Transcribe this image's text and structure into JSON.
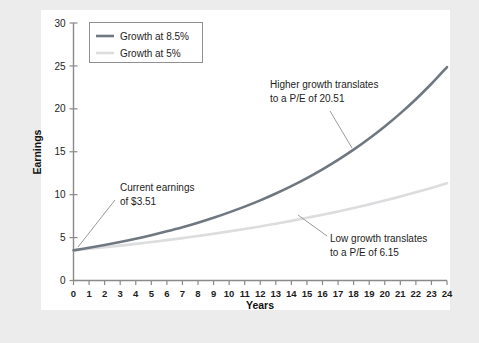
{
  "figure": {
    "background_color": "#ececed",
    "card_color": "#ffffff"
  },
  "chart_data": {
    "type": "line",
    "title": "",
    "xlabel": "Years",
    "ylabel": "Earnings",
    "xlim": [
      0,
      24
    ],
    "ylim": [
      0,
      30
    ],
    "grid": false,
    "legend_position": "top-left",
    "x_ticks": [
      "0",
      "1",
      "2",
      "3",
      "4",
      "5",
      "6",
      "7",
      "8",
      "9",
      "10",
      "11",
      "12",
      "13",
      "14",
      "15",
      "16",
      "17",
      "18",
      "19",
      "20",
      "21",
      "22",
      "23",
      "24"
    ],
    "y_ticks": [
      "0",
      "5",
      "10",
      "15",
      "20",
      "25",
      "30"
    ],
    "x": [
      0,
      1,
      2,
      3,
      4,
      5,
      6,
      7,
      8,
      9,
      10,
      11,
      12,
      13,
      14,
      15,
      16,
      17,
      18,
      19,
      20,
      21,
      22,
      23,
      24
    ],
    "series": [
      {
        "name": "Growth at 8.5%",
        "color": "#6f7881",
        "width": 2.6,
        "values": [
          3.51,
          3.81,
          4.13,
          4.48,
          4.86,
          5.28,
          5.73,
          6.21,
          6.74,
          7.31,
          7.94,
          8.61,
          9.34,
          10.14,
          11.0,
          11.93,
          12.95,
          14.05,
          15.24,
          16.54,
          17.94,
          19.47,
          21.12,
          22.92,
          24.87
        ]
      },
      {
        "name": "Growth at 5%",
        "color": "#dcdddf",
        "width": 2.6,
        "values": [
          3.51,
          3.69,
          3.87,
          4.06,
          4.27,
          4.48,
          4.7,
          4.94,
          5.19,
          5.45,
          5.72,
          6.0,
          6.3,
          6.62,
          6.95,
          7.3,
          7.66,
          8.04,
          8.44,
          8.87,
          9.31,
          9.78,
          10.27,
          10.78,
          11.32
        ]
      }
    ],
    "annotations": [
      {
        "id": "current-earnings",
        "line1": "Current earnings",
        "line2": "of $3.51",
        "text_x": 120,
        "text_y": 191,
        "leader": [
          115,
          200,
          78,
          247
        ]
      },
      {
        "id": "high-growth-pe",
        "line1": "Higher growth translates",
        "line2": "to a P/E of 20.51",
        "text_x": 270,
        "text_y": 88,
        "leader": [
          330,
          111,
          352,
          148
        ]
      },
      {
        "id": "low-growth-pe",
        "line1": "Low growth translates",
        "line2": "to a P/E of 6.15",
        "text_x": 330,
        "text_y": 242,
        "leader": [
          327,
          236,
          298,
          215
        ]
      }
    ]
  }
}
